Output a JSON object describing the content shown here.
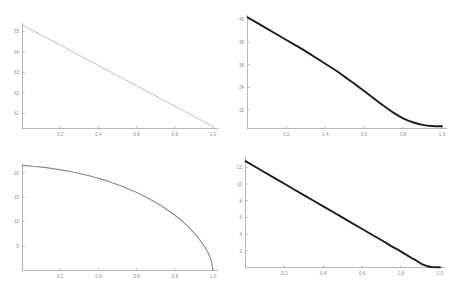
{
  "figure": {
    "layout": "2x2 grid of line plots",
    "background_color": "#ffffff"
  },
  "chart_data": [
    {
      "id": "top-left",
      "type": "line",
      "title": "",
      "xlabel": "",
      "ylabel": "",
      "xlim": [
        0.0,
        1.0
      ],
      "ylim": [
        60.25,
        65.45
      ],
      "grid": false,
      "legend": null,
      "line_color": "#b9b9b9",
      "line_width_px": 0.9,
      "xticks": [
        0.2,
        0.4,
        0.6,
        0.8,
        1.0
      ],
      "xticklabels": [
        "0.2",
        "0.4",
        "0.6",
        "0.8",
        "1.0"
      ],
      "yticks": [
        61,
        62,
        63,
        64,
        65
      ],
      "yticklabels": [
        "61",
        "62",
        "63",
        "64",
        "65"
      ],
      "x": [
        0.0,
        0.05,
        0.1,
        0.15,
        0.2,
        0.25,
        0.3,
        0.35,
        0.4,
        0.45,
        0.5,
        0.55,
        0.6,
        0.65,
        0.7,
        0.75,
        0.8,
        0.85,
        0.9,
        0.95,
        1.0
      ],
      "y": [
        65.35,
        65.1,
        64.85,
        64.6,
        64.35,
        64.1,
        63.85,
        63.6,
        63.35,
        63.1,
        62.85,
        62.6,
        62.35,
        62.1,
        61.85,
        61.6,
        61.35,
        61.1,
        60.85,
        60.6,
        60.35
      ]
    },
    {
      "id": "top-right",
      "type": "line",
      "title": "",
      "xlabel": "",
      "ylabel": "",
      "xlim": [
        0.0,
        1.0
      ],
      "ylim": [
        30.3,
        40.3
      ],
      "grid": false,
      "legend": null,
      "line_color": "#1c1c1c",
      "line_width_px": 1.9,
      "xticks": [
        0.2,
        0.4,
        0.6,
        0.8,
        1.0
      ],
      "xticklabels": [
        "0.2",
        "0.4",
        "0.6",
        "0.8",
        "1.0"
      ],
      "yticks": [
        32,
        34,
        36,
        38,
        40
      ],
      "yticklabels": [
        "32",
        "34",
        "36",
        "38",
        "40"
      ],
      "x": [
        0.0,
        0.05,
        0.1,
        0.15,
        0.2,
        0.25,
        0.3,
        0.35,
        0.4,
        0.45,
        0.5,
        0.55,
        0.6,
        0.65,
        0.7,
        0.75,
        0.8,
        0.85,
        0.9,
        0.95,
        1.0
      ],
      "y": [
        40.1,
        39.6,
        39.1,
        38.6,
        38.1,
        37.6,
        37.1,
        36.55,
        36.0,
        35.45,
        34.85,
        34.25,
        33.6,
        32.95,
        32.3,
        31.7,
        31.2,
        30.85,
        30.62,
        30.52,
        30.5
      ]
    },
    {
      "id": "bottom-left",
      "type": "line",
      "title": "",
      "xlabel": "",
      "ylabel": "",
      "xlim": [
        0.0,
        1.0
      ],
      "ylim": [
        0.0,
        22.0
      ],
      "grid": false,
      "legend": null,
      "line_color": "#8a8a8a",
      "line_width_px": 1.1,
      "xticks": [
        0.2,
        0.4,
        0.6,
        0.8,
        1.0
      ],
      "xticklabels": [
        "0.2",
        "0.4",
        "0.6",
        "0.8",
        "1.0"
      ],
      "yticks": [
        5,
        10,
        15,
        20
      ],
      "yticklabels": [
        "5",
        "10",
        "15",
        "20"
      ],
      "x": [
        0.0,
        0.05,
        0.1,
        0.15,
        0.2,
        0.25,
        0.3,
        0.35,
        0.4,
        0.45,
        0.5,
        0.55,
        0.6,
        0.65,
        0.7,
        0.75,
        0.8,
        0.85,
        0.9,
        0.93,
        0.96,
        0.98,
        0.99,
        1.0
      ],
      "y": [
        21.5,
        21.35,
        21.15,
        20.9,
        20.6,
        20.25,
        19.85,
        19.4,
        18.85,
        18.25,
        17.55,
        16.8,
        15.95,
        15.0,
        13.9,
        12.7,
        11.3,
        9.7,
        7.7,
        6.3,
        4.6,
        3.1,
        2.1,
        0.0
      ]
    },
    {
      "id": "bottom-right",
      "type": "line",
      "title": "",
      "xlabel": "",
      "ylabel": "",
      "xlim": [
        0.0,
        1.0
      ],
      "ylim": [
        0.0,
        13.2
      ],
      "grid": false,
      "legend": null,
      "line_color": "#1c1c1c",
      "line_width_px": 1.9,
      "xticks": [
        0.2,
        0.4,
        0.6,
        0.8,
        1.0
      ],
      "xticklabels": [
        "0.2",
        "0.4",
        "0.6",
        "0.8",
        "1.0"
      ],
      "yticks": [
        2,
        4,
        6,
        8,
        10,
        12
      ],
      "yticklabels": [
        "2",
        "4",
        "6",
        "8",
        "10",
        "12"
      ],
      "x": [
        0.0,
        0.1,
        0.2,
        0.3,
        0.4,
        0.5,
        0.6,
        0.7,
        0.75,
        0.8,
        0.85,
        0.88,
        0.9,
        0.92,
        0.94,
        0.96,
        1.0
      ],
      "y": [
        12.7,
        11.35,
        10.0,
        8.65,
        7.3,
        5.95,
        4.6,
        3.25,
        2.55,
        1.9,
        1.2,
        0.8,
        0.5,
        0.28,
        0.12,
        0.05,
        0.02
      ]
    }
  ]
}
